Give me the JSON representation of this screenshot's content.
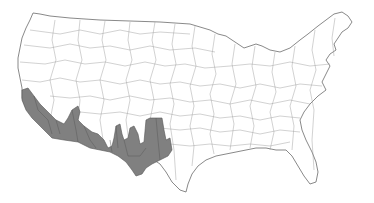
{
  "map": {
    "type": "choropleth",
    "region": "Contiguous United States",
    "division": "county-level boundary regions",
    "colors": {
      "background": "#ffffff",
      "land": "#ffffff",
      "boundary": "#9a9a9a",
      "highlight": "#808080"
    },
    "highlighted_regions": [
      {
        "name": "Southern California / Arizona / New Mexico border region",
        "color": "#808080"
      }
    ],
    "labels": []
  }
}
